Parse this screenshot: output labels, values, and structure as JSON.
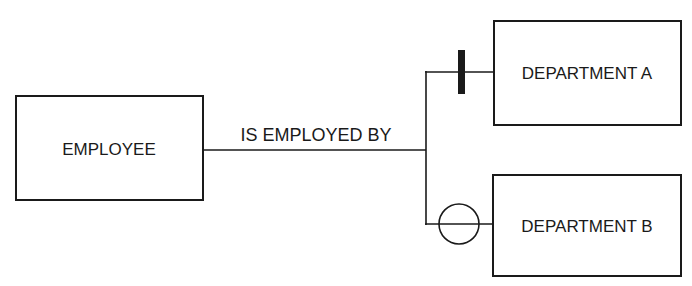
{
  "diagram": {
    "type": "entity-relationship",
    "entities": [
      {
        "id": "employee",
        "label": "EMPLOYEE"
      },
      {
        "id": "department_a",
        "label": "DEPARTMENT A"
      },
      {
        "id": "department_b",
        "label": "DEPARTMENT B"
      }
    ],
    "relationship": {
      "label": "IS EMPLOYED BY",
      "from": "employee",
      "to": [
        "department_a",
        "department_b"
      ]
    },
    "cardinality_markers": [
      {
        "target": "department_a",
        "symbol": "bar",
        "meaning": "exactly one"
      },
      {
        "target": "department_b",
        "symbol": "circle",
        "meaning": "zero / optional"
      }
    ],
    "colors": {
      "stroke": "#1a1a1a",
      "background": "#ffffff"
    }
  }
}
